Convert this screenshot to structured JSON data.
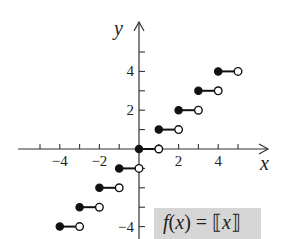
{
  "chart_data": {
    "type": "scatter",
    "title": "",
    "function_label": "f(x) = ⟦x⟧",
    "function_label_parts": {
      "f": "f",
      "open_paren": "(",
      "var": "x",
      "close_paren": ")",
      "equals": "=",
      "lbrack": "⟦",
      "arg": "x",
      "rbrack": "⟧"
    },
    "xlabel": "x",
    "ylabel": "y",
    "xlim": [
      -6,
      6.5
    ],
    "ylim": [
      -4.6,
      6.5
    ],
    "x_ticks": [
      -5,
      -4,
      -3,
      -2,
      -1,
      1,
      2,
      3,
      4,
      5
    ],
    "y_ticks": [
      -4,
      -3,
      -2,
      -1,
      1,
      2,
      3,
      4,
      5
    ],
    "x_tick_labels": [
      {
        "value": -4,
        "label": "−4"
      },
      {
        "value": -2,
        "label": "−2"
      },
      {
        "value": 2,
        "label": "2"
      },
      {
        "value": 4,
        "label": "4"
      }
    ],
    "y_tick_labels": [
      {
        "value": 4,
        "label": "4"
      },
      {
        "value": 2,
        "label": "2"
      },
      {
        "value": -4,
        "label": "−4"
      }
    ],
    "grid": false,
    "series": [
      {
        "name": "greatest integer function",
        "segments": [
          {
            "y": -4,
            "x_start": -4,
            "x_end": -3,
            "start_closed": true,
            "end_closed": false
          },
          {
            "y": -3,
            "x_start": -3,
            "x_end": -2,
            "start_closed": true,
            "end_closed": false
          },
          {
            "y": -2,
            "x_start": -2,
            "x_end": -1,
            "start_closed": true,
            "end_closed": false
          },
          {
            "y": -1,
            "x_start": -1,
            "x_end": 0,
            "start_closed": true,
            "end_closed": false
          },
          {
            "y": 0,
            "x_start": 0,
            "x_end": 1,
            "start_closed": true,
            "end_closed": false
          },
          {
            "y": 1,
            "x_start": 1,
            "x_end": 2,
            "start_closed": true,
            "end_closed": false
          },
          {
            "y": 2,
            "x_start": 2,
            "x_end": 3,
            "start_closed": true,
            "end_closed": false
          },
          {
            "y": 3,
            "x_start": 3,
            "x_end": 4,
            "start_closed": true,
            "end_closed": false
          },
          {
            "y": 4,
            "x_start": 4,
            "x_end": 5,
            "start_closed": true,
            "end_closed": false
          }
        ]
      }
    ]
  },
  "layout": {
    "origin_px": [
      139,
      149
    ],
    "unit_x_px": 19.8,
    "unit_y_px": 19.4,
    "x_axis_px": [
      18,
      268
    ],
    "y_axis_px": [
      22,
      239
    ],
    "colors": {
      "axis": "#333333",
      "ink": "#111111",
      "label_bg": "#d6d6d6"
    }
  }
}
